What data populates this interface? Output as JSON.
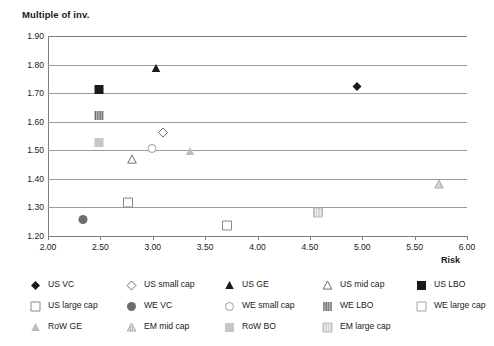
{
  "chart_data": {
    "type": "scatter",
    "title": "Multiple of inv.",
    "xlabel": "Risk",
    "ylabel": "Multiple of inv.",
    "xlim": [
      2.0,
      6.0
    ],
    "ylim": [
      1.2,
      1.9
    ],
    "grid": true,
    "legend_position": "bottom",
    "x_ticks": [
      "2.00",
      "2.50",
      "3.00",
      "3.50",
      "4.00",
      "4.50",
      "5.00",
      "5.50",
      "6.00"
    ],
    "x_tick_values": [
      2.0,
      2.5,
      3.0,
      3.5,
      4.0,
      4.5,
      5.0,
      5.5,
      6.0
    ],
    "y_ticks": [
      "1.90",
      "1.80",
      "1.70",
      "1.60",
      "1.50",
      "1.40",
      "1.30",
      "1.20"
    ],
    "y_tick_values": [
      1.9,
      1.8,
      1.7,
      1.6,
      1.5,
      1.4,
      1.3,
      1.2
    ],
    "points": [
      {
        "name": "US VC",
        "x": 4.95,
        "y": 1.72,
        "marker": "diamond-filled",
        "color": "#1a1a1a"
      },
      {
        "name": "US small cap",
        "x": 3.1,
        "y": 1.56,
        "marker": "diamond-open",
        "color": "#6e6e6e"
      },
      {
        "name": "US GE",
        "x": 3.03,
        "y": 1.785,
        "marker": "triangle-filled",
        "color": "#1a1a1a"
      },
      {
        "name": "US mid cap",
        "x": 2.8,
        "y": 1.465,
        "marker": "triangle-open",
        "color": "#6e6e6e"
      },
      {
        "name": "US LBO",
        "x": 2.49,
        "y": 1.71,
        "marker": "square-filled",
        "color": "#1a1a1a"
      },
      {
        "name": "US large cap",
        "x": 2.76,
        "y": 1.315,
        "marker": "square-open",
        "color": "#6e6e6e"
      },
      {
        "name": "WE VC",
        "x": 2.33,
        "y": 1.257,
        "marker": "circle-filled",
        "color": "#6e6e6e"
      },
      {
        "name": "WE small cap",
        "x": 2.99,
        "y": 1.505,
        "marker": "circle-open",
        "color": "#9a9a9a"
      },
      {
        "name": "WE LBO",
        "x": 2.49,
        "y": 1.62,
        "marker": "square-striped-dark",
        "color": "#7a7a7a"
      },
      {
        "name": "WE large cap",
        "x": 3.71,
        "y": 1.235,
        "marker": "square-open",
        "color": "#9a9a9a"
      },
      {
        "name": "RoW GE",
        "x": 3.36,
        "y": 1.495,
        "marker": "triangle-light",
        "color": "#b8b8b8"
      },
      {
        "name": "EM mid cap",
        "x": 5.73,
        "y": 1.38,
        "marker": "triangle-hatched",
        "color": "#b0b0b0"
      },
      {
        "name": "RoW BO",
        "x": 2.49,
        "y": 1.525,
        "marker": "square-light",
        "color": "#c2c2c2"
      },
      {
        "name": "EM large cap",
        "x": 4.58,
        "y": 1.28,
        "marker": "square-striped-light",
        "color": "#c2c2c2"
      }
    ]
  },
  "legend": {
    "items": [
      {
        "label": "US VC",
        "marker": "diamond-filled",
        "row": 0,
        "col": 0
      },
      {
        "label": "US small cap",
        "marker": "diamond-open",
        "row": 0,
        "col": 1
      },
      {
        "label": "US GE",
        "marker": "triangle-filled",
        "row": 0,
        "col": 2
      },
      {
        "label": "US mid cap",
        "marker": "triangle-open",
        "row": 0,
        "col": 3
      },
      {
        "label": "US LBO",
        "marker": "square-filled",
        "row": 0,
        "col": 4
      },
      {
        "label": "US large cap",
        "marker": "square-open",
        "row": 1,
        "col": 0
      },
      {
        "label": "WE VC",
        "marker": "circle-filled",
        "row": 1,
        "col": 1
      },
      {
        "label": "WE small cap",
        "marker": "circle-open",
        "row": 1,
        "col": 2
      },
      {
        "label": "WE LBO",
        "marker": "square-striped-dark",
        "row": 1,
        "col": 3
      },
      {
        "label": "WE large cap",
        "marker": "square-open-light",
        "row": 1,
        "col": 4
      },
      {
        "label": "RoW GE",
        "marker": "triangle-light",
        "row": 2,
        "col": 0
      },
      {
        "label": "EM mid cap",
        "marker": "triangle-hatched",
        "row": 2,
        "col": 1
      },
      {
        "label": "RoW BO",
        "marker": "square-light",
        "row": 2,
        "col": 2
      },
      {
        "label": "EM large cap",
        "marker": "square-striped-light",
        "row": 2,
        "col": 3
      }
    ]
  },
  "colors": {
    "black": "#1a1a1a",
    "dark_gray": "#6e6e6e",
    "mid_gray": "#9a9a9a",
    "light_gray": "#c2c2c2",
    "gridline": "#9a9a9a",
    "background": "#ffffff"
  }
}
